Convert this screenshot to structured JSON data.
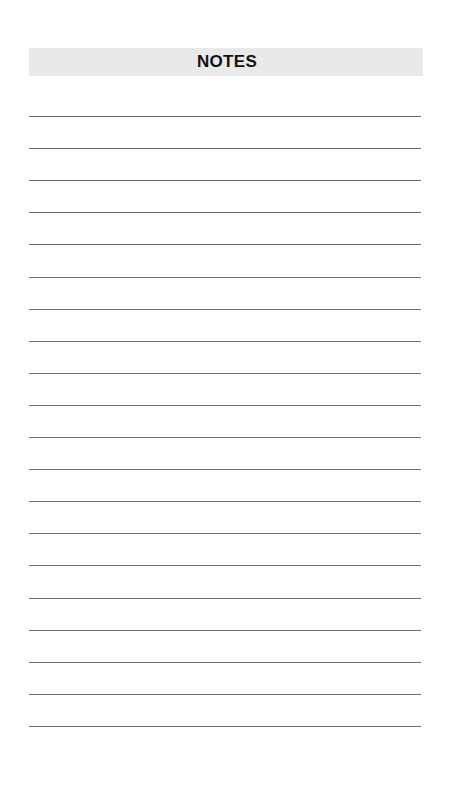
{
  "header": {
    "title": "NOTES",
    "band_color": "#e9e9e9"
  },
  "ruled_lines": {
    "count": 20,
    "start_y": 116,
    "spacing": 32.1,
    "color": "#6f6f6f"
  }
}
